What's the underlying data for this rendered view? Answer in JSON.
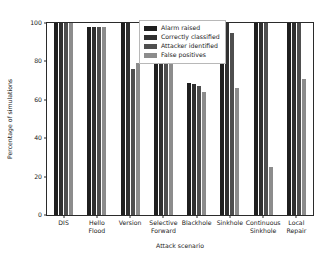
{
  "chart_data": {
    "type": "bar",
    "title": "",
    "xlabel": "Attack scenario",
    "ylabel": "Percentage of simulations",
    "ylim": [
      0,
      100
    ],
    "yticks": [
      0,
      20,
      40,
      60,
      80,
      100
    ],
    "grid": false,
    "legend_position": "upper center",
    "categories": [
      "DIS",
      "Hello\nFlood",
      "Version",
      "Selective\nForward",
      "Blackhole",
      "Sinkhole",
      "Continuous\nSinkhole",
      "Local\nRepair"
    ],
    "series": [
      {
        "name": "Alarm raised",
        "color": "#1f1f1f",
        "values": [
          100,
          98,
          100,
          100,
          69,
          100,
          100,
          100
        ]
      },
      {
        "name": "Correctly classified",
        "color": "#303030",
        "values": [
          100,
          98,
          100,
          100,
          68,
          100,
          100,
          100
        ]
      },
      {
        "name": "Attacker identified",
        "color": "#4f4f4f",
        "values": [
          100,
          98,
          76,
          100,
          67,
          95,
          100,
          100
        ]
      },
      {
        "name": "False positives",
        "color": "#8c8c8c",
        "values": [
          100,
          98,
          79,
          100,
          64,
          66,
          25,
          71
        ]
      }
    ]
  },
  "axes": {
    "ytick_labels": [
      "0",
      "20",
      "40",
      "60",
      "80",
      "100"
    ]
  }
}
